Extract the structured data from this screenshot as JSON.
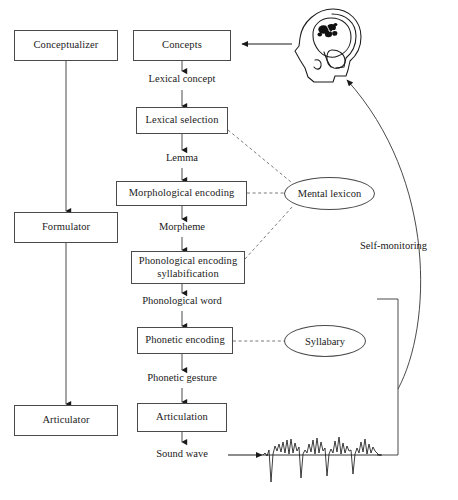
{
  "diagram": {
    "stroke_color": "#4a4a4a",
    "text_color": "#1a1a1a",
    "background_color": "#ffffff",
    "stage_column": {
      "items": [
        {
          "id": "conceptualizer",
          "label": "Conceptualizer"
        },
        {
          "id": "formulator",
          "label": "Formulator"
        },
        {
          "id": "articulator",
          "label": "Articulator"
        }
      ]
    },
    "process_column": {
      "boxes": [
        {
          "id": "concepts",
          "label": "Concepts"
        },
        {
          "id": "lexical-selection",
          "label": "Lexical selection"
        },
        {
          "id": "morphological-encoding",
          "label": "Morphological encoding"
        },
        {
          "id": "phonological-encoding",
          "label_line1": "Phonological encoding",
          "label_line2": "syllabification"
        },
        {
          "id": "phonetic-encoding",
          "label": "Phonetic encoding"
        },
        {
          "id": "articulation",
          "label": "Articulation"
        }
      ],
      "edge_labels": [
        {
          "id": "lexical-concept",
          "label": "Lexical concept"
        },
        {
          "id": "lemma",
          "label": "Lemma"
        },
        {
          "id": "morpheme",
          "label": "Morpheme"
        },
        {
          "id": "phonological-word",
          "label": "Phonological word"
        },
        {
          "id": "phonetic-gesture",
          "label": "Phonetic gesture"
        },
        {
          "id": "sound-wave",
          "label": "Sound wave"
        }
      ]
    },
    "knowledge_stores": [
      {
        "id": "mental-lexicon",
        "label": "Mental lexicon"
      },
      {
        "id": "syllabary",
        "label": "Syllabary"
      }
    ],
    "annotations": [
      {
        "id": "self-monitoring",
        "label": "Self-monitoring"
      }
    ],
    "icons": [
      {
        "id": "head-brain",
        "name": "head-brain-icon"
      },
      {
        "id": "sound-waveform",
        "name": "sound-waveform-icon"
      }
    ]
  }
}
